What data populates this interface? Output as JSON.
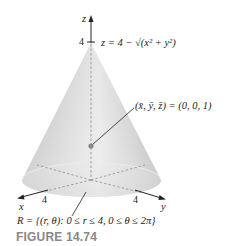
{
  "figure": {
    "caption": "FIGURE 14.74",
    "surface_equation": "z = 4 − √(x² + y²)",
    "centroid_label": "(x̄, ȳ, z̄) = (0, 0, 1)",
    "region_label": "R = {(r, θ): 0 ≤ r ≤ 4, 0 ≤ θ ≤ 2π}",
    "axes": {
      "z": {
        "label": "z",
        "tick": "4"
      },
      "x": {
        "label": "x",
        "tick": "4"
      },
      "y": {
        "label": "y",
        "tick": "4"
      }
    },
    "colors": {
      "cone_light": "#f2f2f2",
      "cone_mid": "#cfcfcf",
      "cone_dark": "#a8a8a8",
      "axis": "#222222",
      "caption": "#888888",
      "point": "#8a8a8a"
    }
  }
}
